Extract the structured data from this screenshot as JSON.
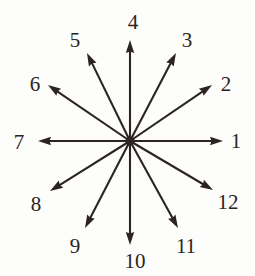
{
  "figure": {
    "background_color": "#fdfdfc",
    "stroke_color": "#2b2420",
    "label_color": "#2b2420",
    "center": {
      "x": 130,
      "y": 141
    },
    "stroke_width": 2.1,
    "arrowhead_length": 13,
    "arrowhead_half_width": 4.2
  },
  "chart_data": {
    "type": "scatter",
    "title": "",
    "xlabel": "",
    "ylabel": "",
    "center": {
      "x": 130,
      "y": 141
    },
    "spoke_count": 12,
    "vectors": [
      {
        "label": "1",
        "angle_deg": 0,
        "length": 93,
        "tip": {
          "x": 223,
          "y": 141
        },
        "label_pos": {
          "x": 236,
          "y": 141
        }
      },
      {
        "label": "2",
        "angle_deg": 30,
        "length": 95,
        "tip": {
          "x": 212,
          "y": 85
        },
        "label_pos": {
          "x": 226,
          "y": 84
        }
      },
      {
        "label": "3",
        "angle_deg": 60,
        "length": 93,
        "tip": {
          "x": 176,
          "y": 53
        },
        "label_pos": {
          "x": 187,
          "y": 40
        }
      },
      {
        "label": "4",
        "angle_deg": 90,
        "length": 101,
        "tip": {
          "x": 130,
          "y": 40
        },
        "label_pos": {
          "x": 133,
          "y": 22
        }
      },
      {
        "label": "5",
        "angle_deg": 120,
        "length": 94,
        "tip": {
          "x": 87,
          "y": 53
        },
        "label_pos": {
          "x": 75,
          "y": 40
        }
      },
      {
        "label": "6",
        "angle_deg": 150,
        "length": 94,
        "tip": {
          "x": 48,
          "y": 85
        },
        "label_pos": {
          "x": 35,
          "y": 84
        }
      },
      {
        "label": "7",
        "angle_deg": 180,
        "length": 92,
        "tip": {
          "x": 38,
          "y": 141
        },
        "label_pos": {
          "x": 19,
          "y": 142
        }
      },
      {
        "label": "8",
        "angle_deg": 210,
        "length": 92,
        "tip": {
          "x": 50,
          "y": 191
        },
        "label_pos": {
          "x": 36,
          "y": 204
        }
      },
      {
        "label": "9",
        "angle_deg": 240,
        "length": 94,
        "tip": {
          "x": 85,
          "y": 228
        },
        "label_pos": {
          "x": 75,
          "y": 246
        }
      },
      {
        "label": "10",
        "angle_deg": 270,
        "length": 104,
        "tip": {
          "x": 130,
          "y": 245
        },
        "label_pos": {
          "x": 135,
          "y": 261
        }
      },
      {
        "label": "11",
        "angle_deg": 300,
        "length": 94,
        "tip": {
          "x": 178,
          "y": 228
        },
        "label_pos": {
          "x": 186,
          "y": 246
        }
      },
      {
        "label": "12",
        "angle_deg": 330,
        "length": 92,
        "tip": {
          "x": 213,
          "y": 190
        },
        "label_pos": {
          "x": 228,
          "y": 202
        }
      }
    ]
  }
}
